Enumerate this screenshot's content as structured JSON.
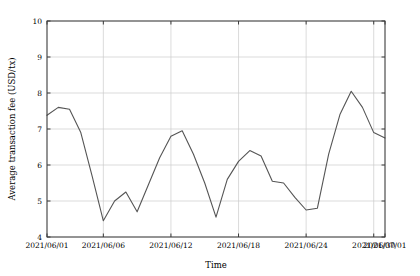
{
  "chart_data": {
    "type": "line",
    "title": "",
    "xlabel": "Time",
    "ylabel": "Average transaction fee (USD/tx)",
    "ylim": [
      4,
      10
    ],
    "yticks": [
      4,
      5,
      6,
      7,
      8,
      9,
      10
    ],
    "ytick_labels": [
      "4",
      "5",
      "6",
      "7",
      "8",
      "9",
      "10"
    ],
    "xlim": [
      "2021/06/01",
      "2021/07/01"
    ],
    "xticks": [
      "2021/06/01",
      "2021/06/06",
      "2021/06/12",
      "2021/06/18",
      "2021/06/24",
      "2021/06/30",
      "2021/07/01"
    ],
    "xtick_positions": [
      0,
      5,
      11,
      17,
      23,
      29,
      30
    ],
    "grid": true,
    "legend": null,
    "line_color": "#555555",
    "grid_color": "#cccccc",
    "axis_color": "#3a3a3a",
    "x": [
      "2021/06/01",
      "2021/06/02",
      "2021/06/03",
      "2021/06/04",
      "2021/06/05",
      "2021/06/06",
      "2021/06/07",
      "2021/06/08",
      "2021/06/09",
      "2021/06/10",
      "2021/06/11",
      "2021/06/12",
      "2021/06/13",
      "2021/06/14",
      "2021/06/15",
      "2021/06/16",
      "2021/06/17",
      "2021/06/18",
      "2021/06/19",
      "2021/06/20",
      "2021/06/21",
      "2021/06/22",
      "2021/06/23",
      "2021/06/24",
      "2021/06/25",
      "2021/06/26",
      "2021/06/27",
      "2021/06/28",
      "2021/06/29",
      "2021/06/30",
      "2021/07/01"
    ],
    "values": [
      7.38,
      7.6,
      7.55,
      6.9,
      5.7,
      4.45,
      5.0,
      5.25,
      4.7,
      5.45,
      6.2,
      6.8,
      6.95,
      6.3,
      5.5,
      4.55,
      5.6,
      6.1,
      6.4,
      6.25,
      5.55,
      5.5,
      5.1,
      4.75,
      4.8,
      6.3,
      7.4,
      8.05,
      7.6,
      6.9,
      6.75
    ]
  }
}
